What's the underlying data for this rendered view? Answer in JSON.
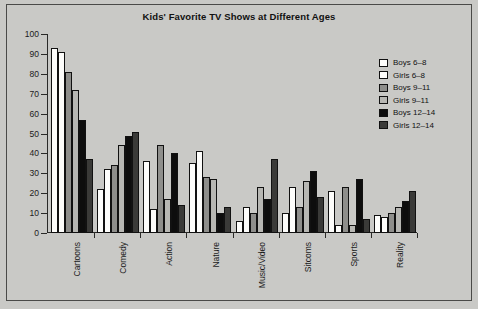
{
  "chart_data": {
    "type": "bar",
    "title": "Kids' Favorite TV Shows at Different Ages",
    "xlabel": "",
    "ylabel": "",
    "ylim": [
      0,
      100
    ],
    "yticks": [
      0,
      10,
      20,
      30,
      40,
      50,
      60,
      70,
      80,
      90,
      100
    ],
    "grid": false,
    "legend_position": "right",
    "categories": [
      "Cartoons",
      "Comedy",
      "Action",
      "Nature",
      "Music/Video",
      "Sitcoms",
      "Sports",
      "Reality"
    ],
    "series": [
      {
        "name": "Boys 6-8",
        "color": "#fdfdfb",
        "values": [
          93,
          22,
          36,
          35,
          6,
          10,
          21,
          9
        ]
      },
      {
        "name": "Girls 6-8",
        "color": "#fdfdfb",
        "values": [
          91,
          32,
          12,
          41,
          13,
          23,
          4,
          8
        ]
      },
      {
        "name": "Boys 9-11",
        "color": "#8e8e8b",
        "values": [
          81,
          34,
          44,
          28,
          10,
          13,
          23,
          10
        ]
      },
      {
        "name": "Girls 9-11",
        "color": "#b7b7b3",
        "values": [
          72,
          44,
          17,
          27,
          23,
          26,
          4,
          13
        ]
      },
      {
        "name": "Boys 12-14",
        "color": "#0d0d0d",
        "values": [
          57,
          49,
          40,
          10,
          17,
          31,
          27,
          16
        ]
      },
      {
        "name": "Girls 12-14",
        "color": "#3a3a38",
        "values": [
          37,
          51,
          14,
          13,
          37,
          18,
          7,
          21
        ]
      }
    ]
  }
}
